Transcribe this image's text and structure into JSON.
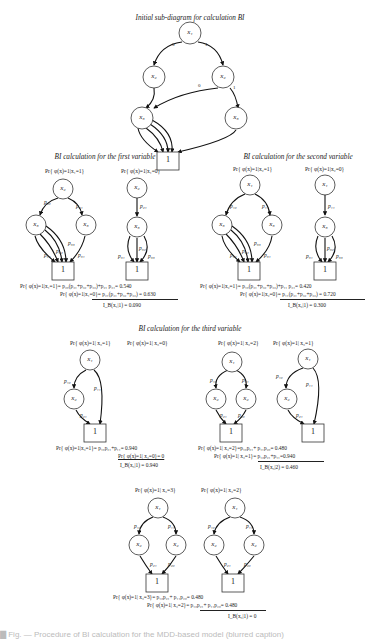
{
  "figure": {
    "initial": {
      "title": "Initial sub-diagram for calculation BI"
    },
    "first": {
      "title": "BI calculation for the first variable",
      "left_label": "Pr{ φ(x)=1|x₁=1}",
      "right_label": "Pr{ φ(x)=1|x₁=0}",
      "eq1": "Pr{ φ(x)=1|x₁=1}= p₂₀(p₃₁+p₃₂+p₃₃)+p₂₁ p₃₁= 0.540",
      "eq2": "Pr{ φ(x)=1|x₁=0}= p₂₁(p₃₁+p₃₂+p₃₃) = 0.630",
      "result": "I_B(x₁|1) = 0.090"
    },
    "second": {
      "title": "BI calculation for the second variable",
      "left_label": "Pr{ φ(x)=1|x₂=1}",
      "right_label": "Pr{ φ(x)=1|x₂=0}",
      "eq1": "Pr{ φ(x)=1|x₂=1}= p₁₀(p₃₁+p₃₂+p₃₃)+p₁₁ p₃₁= 0.420",
      "eq2": "Pr{ φ(x)=1|x₂=0}= p₁₁(p₃₁+p₃₂+p₃₃) = 0.720",
      "result": "I_B(x₂|1) = 0.300"
    },
    "third": {
      "title": "BI calculation for the third variable",
      "labels": [
        "Pr{ φ(x)=1| x₃=1}",
        "Pr{ φ(x)=1| x₃=0}",
        "Pr{ φ(x)=1| x₃=2}",
        "Pr{ φ(x)=1| x₃=1}",
        "Pr{ φ(x)=1| x₃=3}",
        "Pr{ φ(x)=1| x₃=2}"
      ],
      "eqA1": "Pr{ φ(x)=1|x₃=1}= p₁₀p₂₁+p₁₁= 0.940",
      "eqA2": "Pr{ φ(x)=1| x₃=0}= 0",
      "resA": "I_B(x₃|1) = 0.940",
      "eqB1": "Pr{ φ(x)=1| x₃=2}=p₁₀p₂₁+ p₁₁p₂₀= 0.480",
      "eqB2": "Pr{ φ(x)=1| x₃=1}= p₁₀p₂₁+p₁₁=0.940",
      "resB": "I_B(x₃|2) = 0.460",
      "eqC1": "Pr{ φ(x)=1| x₃=3}= p₁₀p₂₁+ p₁₁p₂₀= 0.480",
      "eqC2": "Pr{ φ(x)=1| x₃=2}= p₁₀p₂₁+ p₁₁p₂₀= 0.480",
      "resC": "I_B(x₃|1) = 0"
    },
    "nodes": {
      "x1": "x₁",
      "x2": "x₂",
      "x3": "x₃",
      "one": "1",
      "p10": "p₁₀",
      "p11": "p₁₁",
      "p20": "p₂₀",
      "p21": "p₂₁",
      "p31": "p₃₁",
      "p32": "p₃₂",
      "p33": "p₃₃",
      "e0": "0",
      "e1": "1",
      "e2": "2",
      "e3": "3"
    },
    "caption": "▇ Fig. — Procedure of BI calculation for the MDD-based model (blurred caption)"
  }
}
